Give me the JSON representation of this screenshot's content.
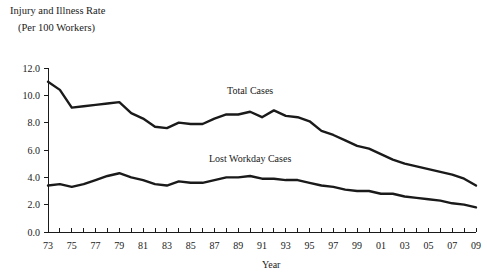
{
  "chart_data": {
    "type": "line",
    "title": "Injury and Illness Rate",
    "subtitle": "(Per 100 Workers)",
    "xlabel": "Year",
    "ylabel": "",
    "grid": false,
    "legend_position": "inline-annotation",
    "xlim": [
      1973,
      2009
    ],
    "ylim": [
      0.0,
      12.0
    ],
    "ytick_labels": [
      "0.0",
      "2.0",
      "4.0",
      "6.0",
      "8.0",
      "10.0",
      "12.0"
    ],
    "ytick_values": [
      0.0,
      2.0,
      4.0,
      6.0,
      8.0,
      10.0,
      12.0
    ],
    "xtick_labels": [
      "73",
      "75",
      "77",
      "79",
      "81",
      "83",
      "85",
      "87",
      "89",
      "91",
      "93",
      "95",
      "97",
      "99",
      "01",
      "03",
      "05",
      "07",
      "09"
    ],
    "xtick_values": [
      1973,
      1975,
      1977,
      1979,
      1981,
      1983,
      1985,
      1987,
      1989,
      1991,
      1993,
      1995,
      1997,
      1999,
      2001,
      2003,
      2005,
      2007,
      2009
    ],
    "x": [
      1973,
      1974,
      1975,
      1976,
      1977,
      1978,
      1979,
      1980,
      1981,
      1982,
      1983,
      1984,
      1985,
      1986,
      1987,
      1988,
      1989,
      1990,
      1991,
      1992,
      1993,
      1994,
      1995,
      1996,
      1997,
      1998,
      1999,
      2000,
      2001,
      2002,
      2003,
      2004,
      2005,
      2006,
      2007,
      2008,
      2009
    ],
    "series": [
      {
        "name": "Total Cases",
        "label": "Total Cases",
        "color": "#1a1a1a",
        "label_x": 1990,
        "label_y": 10.1,
        "values": [
          11.0,
          10.4,
          9.1,
          9.2,
          9.3,
          9.4,
          9.5,
          8.7,
          8.3,
          7.7,
          7.6,
          8.0,
          7.9,
          7.9,
          8.3,
          8.6,
          8.6,
          8.8,
          8.4,
          8.9,
          8.5,
          8.4,
          8.1,
          7.4,
          7.1,
          6.7,
          6.3,
          6.1,
          5.7,
          5.3,
          5.0,
          4.8,
          4.6,
          4.4,
          4.2,
          3.9,
          3.4
        ]
      },
      {
        "name": "Lost Workday Cases",
        "label": "Lost Workday Cases",
        "color": "#1a1a1a",
        "label_x": 1990,
        "label_y": 5.1,
        "values": [
          3.4,
          3.5,
          3.3,
          3.5,
          3.8,
          4.1,
          4.3,
          4.0,
          3.8,
          3.5,
          3.4,
          3.7,
          3.6,
          3.6,
          3.8,
          4.0,
          4.0,
          4.1,
          3.9,
          3.9,
          3.8,
          3.8,
          3.6,
          3.4,
          3.3,
          3.1,
          3.0,
          3.0,
          2.8,
          2.8,
          2.6,
          2.5,
          2.4,
          2.3,
          2.1,
          2.0,
          1.8
        ]
      }
    ]
  },
  "layout": {
    "plot_left": 48,
    "plot_right": 476,
    "plot_top": 68,
    "plot_bottom": 232,
    "title_x": 10,
    "title_y": 14,
    "subtitle_x": 18,
    "subtitle_y": 31,
    "xlabel_x": 262,
    "xlabel_y": 268
  }
}
